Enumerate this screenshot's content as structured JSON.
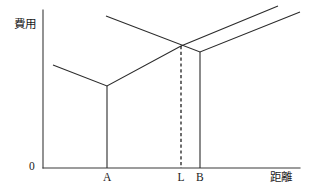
{
  "figure": {
    "type": "line-diagram",
    "background_color": "#ffffff",
    "line_color": "#2b2b2b",
    "axis_color": "#3a3a3a"
  },
  "axes": {
    "y_label": "費用",
    "x_label": "距離",
    "origin_label": "0",
    "y_axis": {
      "x": 43,
      "y_top": 10,
      "y_bottom": 168
    },
    "x_axis": {
      "y": 168,
      "x_left": 43,
      "x_right": 300
    }
  },
  "ticks": {
    "x": [
      {
        "name": "A",
        "label": "A",
        "x": 107
      },
      {
        "name": "L",
        "label": "L",
        "x": 181
      },
      {
        "name": "B",
        "label": "B",
        "x": 200
      }
    ]
  },
  "chart_data": {
    "type": "line",
    "title": "",
    "xlabel": "距離",
    "ylabel": "費用",
    "grid": false,
    "legend": "none",
    "series": [
      {
        "name": "cost-curve-from-A",
        "description": "V-shaped cost schedule anchored at A: falls to a minimum at A then rises to the right, continuing past the crossing point.",
        "points": [
          {
            "x": 53,
            "y": 65
          },
          {
            "x": 107,
            "y": 86
          },
          {
            "x": 181,
            "y": 46
          },
          {
            "x": 278,
            "y": 6
          }
        ]
      },
      {
        "name": "cost-curve-from-B",
        "description": "V-shaped cost schedule anchored at B: falls from the upper left to a minimum at B then rises to the right.",
        "points": [
          {
            "x": 106,
            "y": 16
          },
          {
            "x": 200,
            "y": 52
          },
          {
            "x": 300,
            "y": 12
          }
        ]
      }
    ],
    "vertical_drops": [
      {
        "name": "drop-at-A",
        "x": 107,
        "y_top": 86,
        "y_bottom": 168
      },
      {
        "name": "drop-at-B",
        "x": 200,
        "y_top": 52,
        "y_bottom": 168
      }
    ],
    "dashed_markers": [
      {
        "name": "dashed-at-L",
        "x": 181,
        "y_top": 46,
        "y_bottom": 168
      }
    ],
    "intersection": {
      "name": "crossing-point-L",
      "x": 181,
      "y": 46
    }
  }
}
